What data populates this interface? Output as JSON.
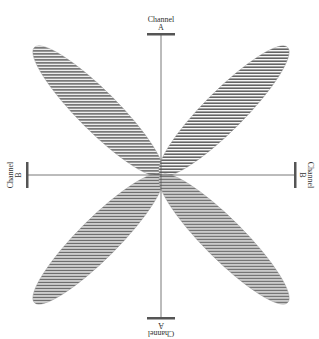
{
  "diagram": {
    "type": "polar-pattern",
    "colors": {
      "axis": "#555555",
      "bar": "#555555",
      "hatch": "#555555",
      "background": "#ffffff"
    },
    "labels": {
      "top": {
        "line1": "Channel",
        "line2": "A"
      },
      "bottom": {
        "line1": "Channel",
        "line2": "A"
      },
      "left": {
        "line1": "Channel",
        "line2": "B"
      },
      "right": {
        "line1": "Channel",
        "line2": "B"
      }
    },
    "lobes": [
      {
        "name": "upper-left",
        "angle_deg": -135
      },
      {
        "name": "upper-right",
        "angle_deg": -45
      },
      {
        "name": "lower-left",
        "angle_deg": 135
      },
      {
        "name": "lower-right",
        "angle_deg": 45
      }
    ]
  }
}
